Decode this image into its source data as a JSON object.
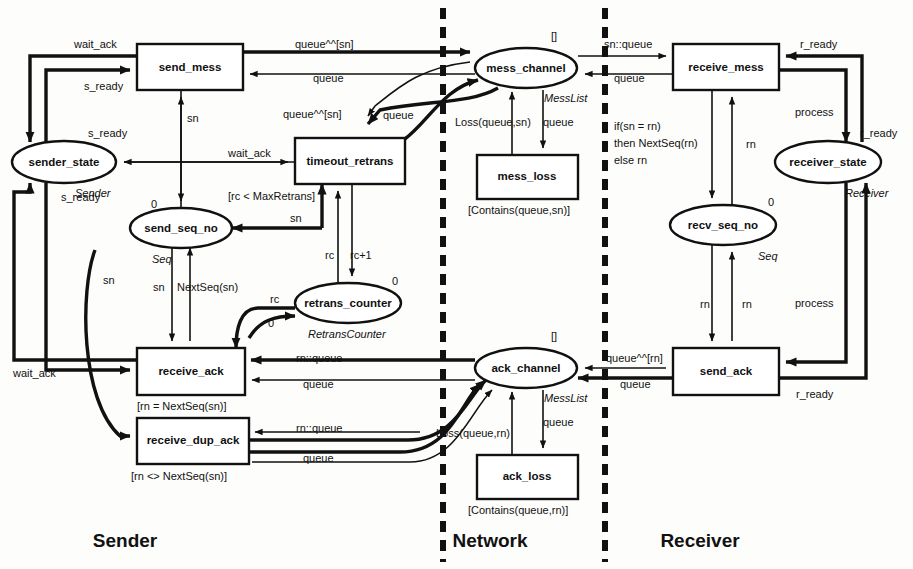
{
  "figure": {
    "type": "petri-net-cpn-diagram",
    "title_partial": "",
    "zones": [
      {
        "id": "sender",
        "label": "Sender",
        "x": 125,
        "y": 547
      },
      {
        "id": "network",
        "label": "Network",
        "x": 490,
        "y": 547
      },
      {
        "id": "receiver",
        "label": "Receiver",
        "x": 700,
        "y": 547
      }
    ],
    "dividers": [
      {
        "id": "divider-sender-network",
        "x": 443
      },
      {
        "id": "divider-network-receiver",
        "x": 605
      }
    ]
  },
  "nodes": {
    "transitions": [
      {
        "id": "send_mess",
        "label": "send_mess",
        "x": 137,
        "y": 44,
        "w": 106,
        "h": 46,
        "guard": null
      },
      {
        "id": "timeout_retrans",
        "label": "timeout_retrans",
        "x": 295,
        "y": 138,
        "w": 110,
        "h": 46,
        "guard": "[rc < MaxRetrans]"
      },
      {
        "id": "receive_ack",
        "label": "receive_ack",
        "x": 137,
        "y": 348,
        "w": 108,
        "h": 47,
        "guard": "[rn = NextSeq(sn)]"
      },
      {
        "id": "receive_dup_ack",
        "label": "receive_dup_ack",
        "x": 137,
        "y": 418,
        "w": 112,
        "h": 46,
        "guard": "[rn <> NextSeq(sn)]"
      },
      {
        "id": "mess_loss",
        "label": "mess_loss",
        "x": 477,
        "y": 155,
        "w": 101,
        "h": 44,
        "guard": "[Contains(queue,sn)]"
      },
      {
        "id": "ack_loss",
        "label": "ack_loss",
        "x": 477,
        "y": 455,
        "w": 101,
        "h": 44,
        "guard": "[Contains(queue,rn)]"
      },
      {
        "id": "receive_mess",
        "label": "receive_mess",
        "x": 673,
        "y": 44,
        "w": 106,
        "h": 46,
        "guard": null
      },
      {
        "id": "send_ack",
        "label": "send_ack",
        "x": 673,
        "y": 348,
        "w": 106,
        "h": 47,
        "guard": null
      }
    ],
    "places": [
      {
        "id": "sender_state",
        "label": "sender_state",
        "cx": 64,
        "cy": 162,
        "rx": 52,
        "ry": 21,
        "type": "Sender",
        "init": null
      },
      {
        "id": "send_seq_no",
        "label": "send_seq_no",
        "cx": 181,
        "cy": 228,
        "rx": 51,
        "ry": 20,
        "type": "Seq",
        "init": "0"
      },
      {
        "id": "retrans_counter",
        "label": "retrans_counter",
        "cx": 348,
        "cy": 303,
        "rx": 53,
        "ry": 20,
        "type": "RetransCounter",
        "init": "0"
      },
      {
        "id": "mess_channel",
        "label": "mess_channel",
        "cx": 526,
        "cy": 68,
        "rx": 51,
        "ry": 20,
        "type": "MessList",
        "init": "[]"
      },
      {
        "id": "ack_channel",
        "label": "ack_channel",
        "cx": 526,
        "cy": 368,
        "rx": 51,
        "ry": 20,
        "type": "MessList",
        "init": "[]"
      },
      {
        "id": "recv_seq_no",
        "label": "recv_seq_no",
        "cx": 723,
        "cy": 225,
        "rx": 53,
        "ry": 20,
        "type": "Seq",
        "init": "0"
      },
      {
        "id": "receiver_state",
        "label": "receiver_state",
        "cx": 828,
        "cy": 162,
        "rx": 53,
        "ry": 21,
        "type": "Receiver",
        "init": null
      }
    ]
  },
  "arc_labels": [
    {
      "id": "lbl-wait-ack-top",
      "text": "wait_ack",
      "x": 74,
      "y": 48
    },
    {
      "id": "lbl-s-ready-top",
      "text": "s_ready",
      "x": 84,
      "y": 90
    },
    {
      "id": "lbl-s-ready-mid",
      "text": "s_ready",
      "x": 88,
      "y": 137
    },
    {
      "id": "lbl-s-ready-low",
      "text": "s_ready",
      "x": 61,
      "y": 201
    },
    {
      "id": "lbl-sn-sendmess",
      "text": "sn",
      "x": 187,
      "y": 122
    },
    {
      "id": "lbl-wait-ack-mid",
      "text": "wait_ack",
      "x": 228,
      "y": 157
    },
    {
      "id": "lbl-sn-timeout",
      "text": "sn",
      "x": 290,
      "y": 222
    },
    {
      "id": "lbl-sn-left",
      "text": "sn",
      "x": 103,
      "y": 284
    },
    {
      "id": "lbl-sn-nextseq-left",
      "text": "sn",
      "x": 153,
      "y": 291
    },
    {
      "id": "lbl-nextseq-sn",
      "text": "NextSeq(sn)",
      "x": 177,
      "y": 291
    },
    {
      "id": "lbl-rc-1",
      "text": "rc",
      "x": 325,
      "y": 259
    },
    {
      "id": "lbl-rc-plus1",
      "text": "rc+1",
      "x": 350,
      "y": 259
    },
    {
      "id": "lbl-rc-2",
      "text": "rc",
      "x": 270,
      "y": 303
    },
    {
      "id": "lbl-zero-retrans",
      "text": "0",
      "x": 268,
      "y": 327
    },
    {
      "id": "lbl-wait-ack-bottom",
      "text": "wait_ack",
      "x": 13,
      "y": 377
    },
    {
      "id": "lbl-queue-sn-top",
      "text": "queue^^[sn]",
      "x": 295,
      "y": 48
    },
    {
      "id": "lbl-queue-top",
      "text": "queue",
      "x": 313,
      "y": 82
    },
    {
      "id": "lbl-queue-sn-mid",
      "text": "queue^^[sn]",
      "x": 283,
      "y": 118
    },
    {
      "id": "lbl-queue-mid",
      "text": "queue",
      "x": 383,
      "y": 119
    },
    {
      "id": "lbl-loss-queue-sn",
      "text": "Loss(queue,sn)",
      "x": 455,
      "y": 126
    },
    {
      "id": "lbl-queue-messloss",
      "text": "queue",
      "x": 543,
      "y": 126
    },
    {
      "id": "lbl-sn-queue",
      "text": "sn::queue",
      "x": 604,
      "y": 48
    },
    {
      "id": "lbl-queue-recvmess",
      "text": "queue",
      "x": 614,
      "y": 82
    },
    {
      "id": "lbl-r-ready-top",
      "text": "r_ready",
      "x": 800,
      "y": 48
    },
    {
      "id": "lbl-process-top",
      "text": "process",
      "x": 795,
      "y": 116
    },
    {
      "id": "lbl-r-ready-mid",
      "text": "r_ready",
      "x": 860,
      "y": 137
    },
    {
      "id": "lbl-if-sn-rn",
      "text": "if(sn = rn)",
      "x": 614,
      "y": 130
    },
    {
      "id": "lbl-then-nextseq",
      "text": "then NextSeq(rn)",
      "x": 614,
      "y": 147
    },
    {
      "id": "lbl-else-rn",
      "text": "else rn",
      "x": 614,
      "y": 164
    },
    {
      "id": "lbl-rn-recvmess",
      "text": "rn",
      "x": 746,
      "y": 148
    },
    {
      "id": "lbl-rn-sendack-1",
      "text": "rn",
      "x": 700,
      "y": 308
    },
    {
      "id": "lbl-rn-sendack-2",
      "text": "rn",
      "x": 742,
      "y": 308
    },
    {
      "id": "lbl-process-bot",
      "text": "process",
      "x": 795,
      "y": 307
    },
    {
      "id": "lbl-r-ready-bot",
      "text": "r_ready",
      "x": 796,
      "y": 398
    },
    {
      "id": "lbl-queue-rn-bot",
      "text": "queue^^[rn]",
      "x": 606,
      "y": 362
    },
    {
      "id": "lbl-queue-sendack",
      "text": "queue",
      "x": 620,
      "y": 388
    },
    {
      "id": "lbl-rn-queue-ack",
      "text": "rn::queue",
      "x": 296,
      "y": 362
    },
    {
      "id": "lbl-queue-recvack",
      "text": "queue",
      "x": 303,
      "y": 388
    },
    {
      "id": "lbl-rn-queue-dup",
      "text": "rn::queue",
      "x": 296,
      "y": 432
    },
    {
      "id": "lbl-queue-dup",
      "text": "queue",
      "x": 303,
      "y": 462
    },
    {
      "id": "lbl-loss-queue-rn",
      "text": "Loss(queue,rn)",
      "x": 436,
      "y": 437
    },
    {
      "id": "lbl-queue-ackloss",
      "text": "queue",
      "x": 543,
      "y": 426
    }
  ]
}
